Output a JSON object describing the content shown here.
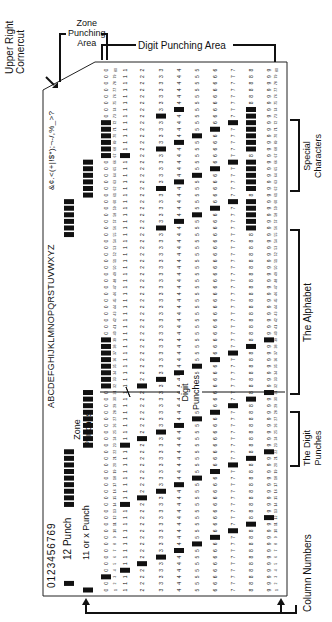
{
  "labels": {
    "upper_right_cornercut": [
      "Upper Right",
      "Cornercut"
    ],
    "zone_punching_area": [
      "Zone",
      "Punching",
      "Area"
    ],
    "digit_punching_area": "Digit Punching Area",
    "special_characters": [
      "Special",
      "Characters"
    ],
    "the_alphabet": "The Alphabet",
    "the_digit_punches": [
      "The Digit",
      "Punches"
    ],
    "column_numbers": "Column Numbers",
    "twelve_punch": "12 Punch",
    "eleven_punch": "11 or x Punch",
    "zone_punches": [
      "Zone",
      "Punches"
    ],
    "digit_punches": [
      "Digit",
      "Punches"
    ]
  },
  "printed_headers": {
    "digits": "0123456769",
    "alphabet": "ABCDEFGHIJKLMNOPQRSTUVWXYZ",
    "special": "&¢.<(+|!$*);¬-/,%_>?"
  },
  "card": {
    "columns": 80,
    "row_labels": [
      "12",
      "11",
      "0",
      "1",
      "2",
      "3",
      "4",
      "5",
      "6",
      "7",
      "8",
      "9"
    ],
    "colors": {
      "ink": "#111111",
      "paper": "#ffffff",
      "punch": "#111111"
    }
  },
  "punched_examples": {
    "digits": [
      [
        "0"
      ],
      [
        "1"
      ],
      [
        "2"
      ],
      [
        "3"
      ],
      [
        "4"
      ],
      [
        "5"
      ],
      [
        "6"
      ],
      [
        "7"
      ],
      [
        "8"
      ],
      [
        "9"
      ]
    ],
    "zone_only": [
      [
        "12"
      ],
      [
        "11"
      ]
    ]
  }
}
